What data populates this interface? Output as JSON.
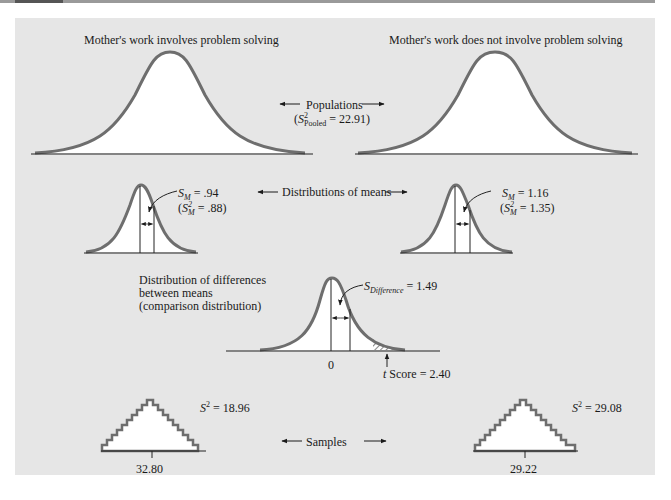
{
  "figure": {
    "populations": {
      "left_title": "Mother's work involves problem solving",
      "right_title": "Mother's work does not involve problem solving",
      "center_label": "Populations",
      "pooled_var_symbol": "S",
      "pooled_var_sup": "2",
      "pooled_var_sub": "Pooled",
      "pooled_var_value": "= 22.91",
      "pooled_var_close": ")"
    },
    "distributions_of_means": {
      "center_label": "Distributions of means",
      "left": {
        "sm_symbol": "S",
        "sm_sub": "M",
        "sm_value": "= .94",
        "var_sup": "2",
        "var_sub": "M",
        "var_value": "= .88"
      },
      "right": {
        "sm_symbol": "S",
        "sm_sub": "M",
        "sm_value": "= 1.16",
        "var_sup": "2",
        "var_sub": "M",
        "var_value": "= 1.35"
      }
    },
    "comparison_distribution": {
      "label_line1": "Distribution of differences",
      "label_line2": "between means",
      "label_line3": "(comparison distribution)",
      "sd_symbol": "S",
      "sd_sub": "Difference",
      "sd_value": "= 1.49",
      "zero_label": "0",
      "t_symbol": "t",
      "t_label": "Score = 2.40"
    },
    "samples": {
      "center_label": "Samples",
      "left": {
        "var_symbol": "S",
        "var_sup": "2",
        "var_value": "= 18.96",
        "mean": "32.80"
      },
      "right": {
        "var_symbol": "S",
        "var_sup": "2",
        "var_value": "= 29.08",
        "mean": "29.22"
      }
    },
    "colors": {
      "panel_bg": "#e6e6e6",
      "curve_stroke": "#6e6e6e",
      "axis": "#222222",
      "fill": "#ffffff"
    }
  }
}
